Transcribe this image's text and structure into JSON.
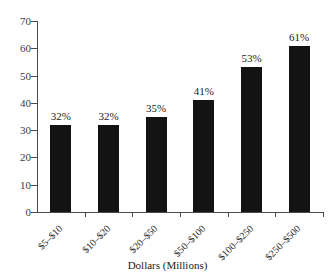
{
  "chart_data": {
    "type": "bar",
    "title": "",
    "subtitle": "",
    "xlabel": "Dollars (Millions)",
    "ylabel": "",
    "categories": [
      "$5–$10",
      "$10–$20",
      "$20–$50",
      "$50–$100",
      "$100–$250",
      "$250–$500"
    ],
    "values": [
      32,
      32,
      35,
      41,
      53,
      61
    ],
    "data_labels": [
      "32%",
      "32%",
      "35%",
      "41%",
      "53%",
      "61%"
    ],
    "ylim": [
      0,
      70
    ],
    "ytick_values": [
      0,
      10,
      20,
      30,
      40,
      50,
      60,
      70
    ],
    "ytick_labels": [
      "0",
      "10",
      "20",
      "30",
      "40",
      "50",
      "60",
      "70"
    ],
    "grid": false,
    "legend": false,
    "legend_position": "none",
    "bar_color": "#131313",
    "axis_color": "#4a4a4a",
    "background_color": "#ffffff",
    "text_color": "#1b1b1b"
  }
}
